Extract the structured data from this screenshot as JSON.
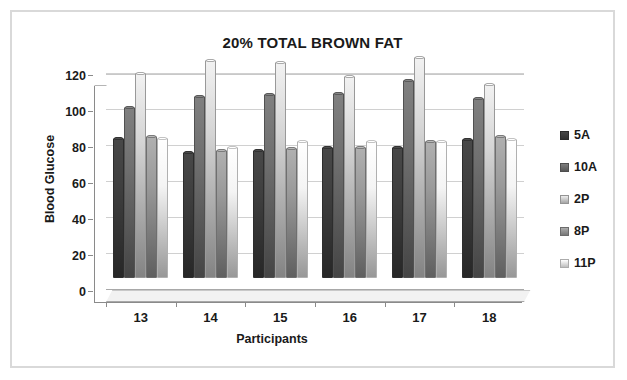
{
  "chart_data": {
    "type": "bar",
    "title": "20% TOTAL BROWN FAT",
    "xlabel": "Participants",
    "ylabel": "Blood Glucose",
    "categories": [
      "13",
      "14",
      "15",
      "16",
      "17",
      "18"
    ],
    "ylim": [
      0,
      120
    ],
    "yticks": [
      0,
      20,
      40,
      60,
      80,
      100,
      120
    ],
    "grid": true,
    "legend_position": "right",
    "series": [
      {
        "name": "5A",
        "color": "#3f3f3f",
        "values": [
          78,
          70,
          71,
          73,
          73,
          77
        ]
      },
      {
        "name": "10A",
        "color": "#707070",
        "values": [
          95,
          101,
          102,
          103,
          110,
          100
        ]
      },
      {
        "name": "2P",
        "color": "#d4d4d4",
        "values": [
          114,
          121,
          120,
          112,
          123,
          108
        ]
      },
      {
        "name": "8P",
        "color": "#9a9a9a",
        "values": [
          79,
          71,
          72,
          73,
          76,
          79
        ]
      },
      {
        "name": "11P",
        "color": "#f4f4f4",
        "values": [
          78,
          73,
          76,
          76,
          76,
          77
        ]
      }
    ]
  },
  "legend": {
    "items": [
      {
        "label": "5A"
      },
      {
        "label": "10A"
      },
      {
        "label": "2P"
      },
      {
        "label": "8P"
      },
      {
        "label": "11P"
      }
    ]
  },
  "axes": {
    "y_tick_labels": [
      "120",
      "100",
      "80",
      "60",
      "40",
      "20",
      "0"
    ],
    "x_tick_labels": [
      "13",
      "14",
      "15",
      "16",
      "17",
      "18"
    ]
  },
  "colors": {
    "frame": "#d9d9d9",
    "gridline": "#d0d0d0",
    "axis": "#8a8a8a",
    "text": "#1a1a1a",
    "floor": "#f2f2f2"
  }
}
